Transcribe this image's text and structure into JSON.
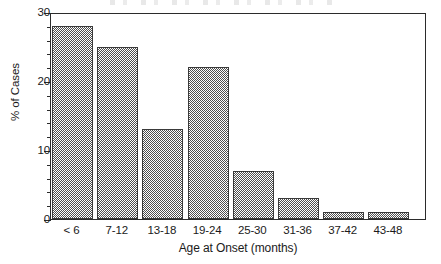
{
  "chart_data": {
    "type": "bar",
    "title": "",
    "xlabel": "Age at Onset (months)",
    "ylabel": "% of Cases",
    "categories": [
      "< 6",
      "7-12",
      "13-18",
      "19-24",
      "25-30",
      "31-36",
      "37-42",
      "43-48"
    ],
    "values": [
      28,
      25,
      13,
      22,
      7,
      3,
      1,
      1
    ],
    "ylim": [
      0,
      30
    ],
    "y_ticks_major": [
      0,
      10,
      20,
      30
    ],
    "y_tick_labels": [
      "0",
      "10",
      "20",
      "30"
    ],
    "y_ticks_minor": [
      2,
      4,
      6,
      8,
      12,
      14,
      16,
      18,
      22,
      24,
      26,
      28
    ],
    "grid": false,
    "legend": false,
    "legend_position": "none",
    "bar_fill": "#4f4f4f",
    "bar_fill_pattern": "50% checkerboard dither",
    "bar_border": "#3a3a3a",
    "axis_color": "#2b2b2b",
    "background": "#ffffff"
  },
  "axes": {
    "y_axis_title": "% of Cases",
    "x_axis_title": "Age at Onset (months)"
  }
}
